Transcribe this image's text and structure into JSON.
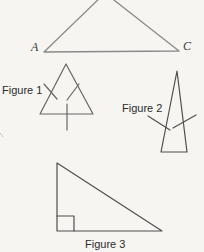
{
  "labels": {
    "vertex_a": "A",
    "vertex_c": "C",
    "figure1": "Figure 1",
    "figure2": "Figure 2",
    "figure3": "Figure 3"
  },
  "colors": {
    "background": "#f6f5f2",
    "line-light": "#8a8a8a",
    "line-mid": "#666666",
    "line-dark": "#4f4f4f",
    "text": "#2b2b2b"
  }
}
